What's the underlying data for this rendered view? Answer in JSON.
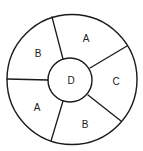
{
  "diagram": {
    "type": "segmented-ring",
    "stroke_color": "#1a1a1a",
    "background": "#ffffff",
    "outer_circle": {
      "cx": 72,
      "cy": 79.5,
      "r": 65
    },
    "inner_circle": {
      "cx": 70,
      "cy": 80,
      "r": 22,
      "label": "D",
      "label_x": 71,
      "label_y": 80
    },
    "dividers": [
      {
        "name": "divider-top-left",
        "x1": 52,
        "y1": 17,
        "x2": 63,
        "y2": 59
      },
      {
        "name": "divider-top-right",
        "x1": 127,
        "y1": 46,
        "x2": 90,
        "y2": 68
      },
      {
        "name": "divider-bottom-right",
        "x1": 121,
        "y1": 121,
        "x2": 88,
        "y2": 95
      },
      {
        "name": "divider-bottom-left",
        "x1": 51,
        "y1": 141,
        "x2": 63,
        "y2": 101
      },
      {
        "name": "divider-left",
        "x1": 7,
        "y1": 79,
        "x2": 48,
        "y2": 80
      }
    ],
    "segments": [
      {
        "name": "segment-upper-left",
        "label": "B",
        "x": 38,
        "y": 53
      },
      {
        "name": "segment-top",
        "label": "A",
        "x": 86,
        "y": 38
      },
      {
        "name": "segment-right",
        "label": "C",
        "x": 116,
        "y": 81
      },
      {
        "name": "segment-bottom",
        "label": "B",
        "x": 85,
        "y": 124
      },
      {
        "name": "segment-lower-left",
        "label": "A",
        "x": 37,
        "y": 107
      }
    ]
  }
}
